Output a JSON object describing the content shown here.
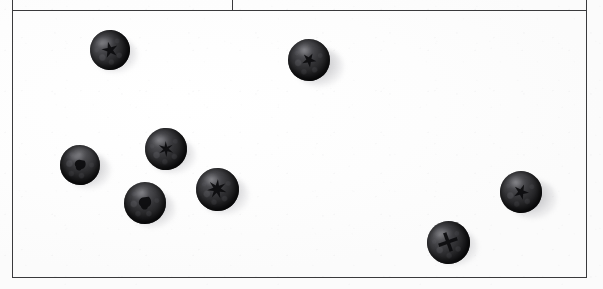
{
  "document": {
    "kind": "scanned-table-cell",
    "background_color": "#fdfdfd",
    "rule_color": "#3a3a3c",
    "caption": ""
  },
  "frame": {
    "label": "table-frame",
    "left": 12,
    "top": 10,
    "right": 586,
    "bottom": 277,
    "partial_row_top": {
      "label": "partial-row-above",
      "top": 0,
      "bottom": 10,
      "divider_x": 232
    }
  },
  "rules": [
    {
      "name": "rule-top-partial",
      "orient": "h",
      "x": 12,
      "y": 10,
      "length": 574
    },
    {
      "name": "rule-divider-top",
      "orient": "v",
      "x": 232,
      "y": 0,
      "length": 10
    },
    {
      "name": "rule-left",
      "orient": "v",
      "x": 12,
      "y": 0,
      "length": 277
    },
    {
      "name": "rule-right",
      "orient": "v",
      "x": 586,
      "y": 0,
      "length": 277
    },
    {
      "name": "rule-bottom",
      "orient": "h",
      "x": 12,
      "y": 277,
      "length": 575
    }
  ],
  "content": {
    "subject": "blueberries",
    "count": 8,
    "color_note": "desaturated grayscale scan",
    "berry_fill": "#242426",
    "shadow_color": "#76767c"
  },
  "berries": [
    {
      "name": "berry-top-left",
      "cx": 110,
      "cy": 50,
      "d": 40,
      "rot": -18,
      "calyx": "star-5",
      "calyx_size": 17,
      "shadow_dx": 6,
      "shadow_dy": 5,
      "shadow_scale": 1.1
    },
    {
      "name": "berry-top-middle",
      "cx": 309,
      "cy": 60,
      "d": 42,
      "rot": 12,
      "calyx": "star-5",
      "calyx_size": 15,
      "shadow_dx": 11,
      "shadow_dy": 7,
      "shadow_scale": 1.14
    },
    {
      "name": "berry-mid-left",
      "cx": 80,
      "cy": 165,
      "d": 40,
      "rot": 34,
      "calyx": "blob",
      "calyx_size": 14,
      "shadow_dx": 9,
      "shadow_dy": 5,
      "shadow_scale": 1.12
    },
    {
      "name": "berry-cluster-upper",
      "cx": 166,
      "cy": 149,
      "d": 42,
      "rot": -6,
      "calyx": "star-6",
      "calyx_size": 16,
      "shadow_dx": 7,
      "shadow_dy": 6,
      "shadow_scale": 1.08
    },
    {
      "name": "berry-cluster-lower",
      "cx": 145,
      "cy": 203,
      "d": 42,
      "rot": 22,
      "calyx": "blob",
      "calyx_size": 16,
      "shadow_dx": 8,
      "shadow_dy": 6,
      "shadow_scale": 1.1
    },
    {
      "name": "berry-cluster-right",
      "cx": 217,
      "cy": 189,
      "d": 43,
      "rot": 4,
      "calyx": "star-7",
      "calyx_size": 20,
      "shadow_dx": 8,
      "shadow_dy": 6,
      "shadow_scale": 1.12
    },
    {
      "name": "berry-bottom-right",
      "cx": 448,
      "cy": 242,
      "d": 43,
      "rot": -14,
      "calyx": "cross",
      "calyx_size": 20,
      "shadow_dx": 7,
      "shadow_dy": 5,
      "shadow_scale": 1.08
    },
    {
      "name": "berry-far-right",
      "cx": 521,
      "cy": 192,
      "d": 42,
      "rot": 8,
      "calyx": "star-5",
      "calyx_size": 16,
      "shadow_dx": 12,
      "shadow_dy": 7,
      "shadow_scale": 1.16
    }
  ]
}
